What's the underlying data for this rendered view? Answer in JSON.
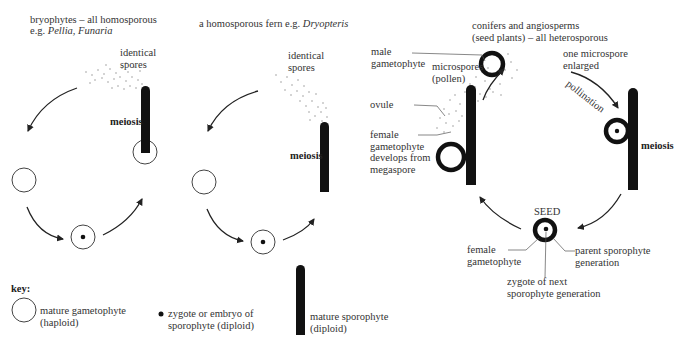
{
  "panels": {
    "bryophytes": {
      "title": "bryophytes – all homosporous",
      "example_prefix": "e.g. ",
      "example": "Pellia, Funaria",
      "spores_label_1": "identical",
      "spores_label_2": "spores",
      "meiosis_label": "meiosis"
    },
    "fern": {
      "title": "a homosporous fern e.g. ",
      "example": "Dryopteris",
      "spores_label_1": "identical",
      "spores_label_2": "spores",
      "meiosis_label": "meiosis"
    },
    "seed_plants": {
      "title_1": "conifers and angiosperms",
      "title_2": "(seed plants) – all heterosporous",
      "male_gametophyte_1": "male",
      "male_gametophyte_2": "gametophyte",
      "microspores_1": "microspores",
      "microspores_2": "(pollen)",
      "one_microspore_1": "one microspore",
      "one_microspore_2": "enlarged",
      "pollination_label": "pollination",
      "ovule_label": "ovule",
      "female_gametophyte_1": "female",
      "female_gametophyte_2": "gametophyte",
      "female_gametophyte_3": "develops from",
      "female_gametophyte_4": "megaspore",
      "meiosis_label": "meiosis",
      "seed_label": "SEED",
      "seed_female_1": "female",
      "seed_female_2": "gametophyte",
      "parent_1": "parent sporophyte",
      "parent_2": "generation",
      "zygote_1": "zygote of next",
      "zygote_2": "sporophyte generation"
    }
  },
  "key": {
    "title": "key:",
    "items": [
      {
        "symbol": "open-circle",
        "line1": "mature gametophyte",
        "line2": "(haploid)"
      },
      {
        "symbol": "dot",
        "line1": "zygote or embryo of",
        "line2": "sporophyte (diploid)"
      },
      {
        "symbol": "black-bar",
        "line1": "mature sporophyte",
        "line2": "(diploid)"
      }
    ]
  }
}
